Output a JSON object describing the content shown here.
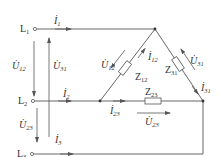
{
  "diagram": {
    "colors": {
      "line": "#555555",
      "text": "#333333",
      "background": "#ffffff"
    },
    "terminals": [
      {
        "id": "L1",
        "letter": "L",
        "sub": "1"
      },
      {
        "id": "L2",
        "letter": "L",
        "sub": "2"
      },
      {
        "id": "L3",
        "letter": "L",
        "sub": "3"
      }
    ],
    "line_currents": [
      {
        "id": "I1",
        "letter": "İ",
        "sub": "1"
      },
      {
        "id": "I2",
        "letter": "İ",
        "sub": "2"
      },
      {
        "id": "I3",
        "letter": "İ",
        "sub": "3"
      }
    ],
    "line_voltages": [
      {
        "id": "U12_left",
        "letter": "U̇",
        "sub": "12"
      },
      {
        "id": "U31_left",
        "letter": "U̇",
        "sub": "31"
      },
      {
        "id": "U23_left",
        "letter": "U̇",
        "sub": "23"
      }
    ],
    "impedances": [
      {
        "id": "Z12",
        "letter": "Z",
        "sub": "12"
      },
      {
        "id": "Z31",
        "letter": "Z",
        "sub": "31"
      },
      {
        "id": "Z23",
        "letter": "Z",
        "sub": "23"
      }
    ],
    "phase_currents": [
      {
        "id": "I12",
        "letter": "İ",
        "sub": "12"
      },
      {
        "id": "I31",
        "letter": "İ",
        "sub": "31"
      },
      {
        "id": "I23",
        "letter": "İ",
        "sub": "23"
      }
    ],
    "phase_voltages": [
      {
        "id": "U12_phase",
        "letter": "U̇",
        "sub": "12"
      },
      {
        "id": "U31_phase",
        "letter": "U̇",
        "sub": "31"
      },
      {
        "id": "U23_phase",
        "letter": "U̇",
        "sub": "23"
      }
    ]
  }
}
